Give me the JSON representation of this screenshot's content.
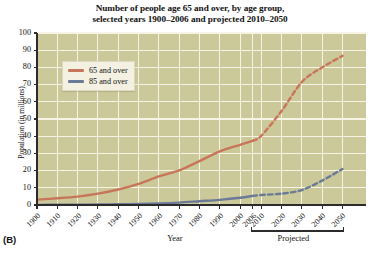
{
  "figure": {
    "panel_label": "(B)",
    "title_line1": "Number of people age 65 and over, by age group,",
    "title_line2": "selected years 1900–2006 and projected 2010–2050",
    "plot_background": "#cbc89a",
    "gridline_color": "#f7f4e6",
    "axis_color": "#2b2b2b"
  },
  "legend": {
    "position": "inside-top-left",
    "entries": [
      {
        "label": "65 and over",
        "color": "#c8765a"
      },
      {
        "label": "85 and over",
        "color": "#6b7a96"
      }
    ]
  },
  "axes": {
    "xlabel": "Year",
    "ylabel": "Population (in millions)",
    "projected_label": "Projected",
    "yticks": [
      0,
      10,
      20,
      30,
      40,
      50,
      60,
      70,
      80,
      90,
      100
    ],
    "ylim": [
      0,
      100
    ],
    "xticks": [
      "1900",
      "1910",
      "1920",
      "1930",
      "1940",
      "1950",
      "1960",
      "1970",
      "1980",
      "1990",
      "2000",
      "2006",
      "2010",
      "2020",
      "2030",
      "2040",
      "2050"
    ],
    "xlim": [
      1900,
      2050
    ],
    "projected_range": [
      "2006",
      "2050"
    ]
  },
  "chart_data": {
    "type": "line",
    "title": "Number of people age 65 and over, by age group, selected years 1900–2006 and projected 2010–2050",
    "xlabel": "Year",
    "ylabel": "Population (in millions)",
    "xlim": [
      1900,
      2050
    ],
    "ylim": [
      0,
      100
    ],
    "grid": true,
    "legend_position": "upper left inside",
    "x": [
      1900,
      1910,
      1920,
      1930,
      1940,
      1950,
      1960,
      1970,
      1980,
      1990,
      2000,
      2006,
      2010,
      2020,
      2030,
      2040,
      2050
    ],
    "series": [
      {
        "name": "65 and over",
        "color": "#c8765a",
        "values": [
          3.1,
          3.9,
          4.9,
          6.6,
          9.0,
          12.3,
          16.6,
          20.1,
          25.5,
          31.2,
          35.0,
          37.3,
          40.2,
          54.6,
          71.5,
          80.0,
          86.7
        ],
        "solid_until": 2006,
        "dashed_from": 2006,
        "style": "solid-then-dashed"
      },
      {
        "name": "85 and over",
        "color": "#6b7a96",
        "values": [
          0.1,
          0.2,
          0.2,
          0.3,
          0.4,
          0.6,
          0.9,
          1.4,
          2.2,
          3.0,
          4.2,
          5.3,
          5.8,
          6.6,
          8.7,
          14.2,
          20.9
        ],
        "solid_until": 2006,
        "dashed_from": 2006,
        "style": "solid-then-dashed"
      }
    ],
    "annotations": [
      {
        "text": "Projected",
        "x_range": [
          2006,
          2050
        ],
        "position": "below-axis"
      },
      {
        "text": "(B)",
        "position": "bottom-left-outside"
      }
    ]
  }
}
